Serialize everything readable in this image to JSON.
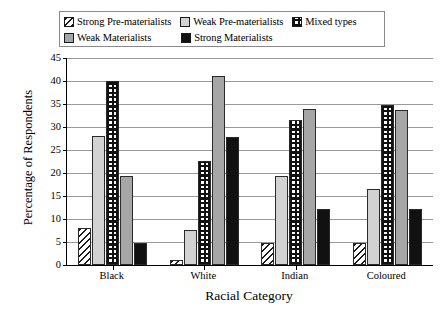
{
  "chart_data": {
    "type": "bar",
    "title": "",
    "xlabel": "Racial Category",
    "ylabel": "Percentage of Respondents",
    "categories": [
      "Black",
      "White",
      "Indian",
      "Coloured"
    ],
    "ylim": [
      0,
      45
    ],
    "yticks": [
      0,
      5,
      10,
      15,
      20,
      25,
      30,
      35,
      40,
      45
    ],
    "grid": true,
    "legend_position": "top",
    "series": [
      {
        "name": "Strong Pre-materialists",
        "pattern": "diagonal-hatch",
        "color": "#ffffff",
        "values": [
          8.0,
          1.0,
          4.8,
          4.8
        ]
      },
      {
        "name": "Weak Pre-materialists",
        "pattern": "light-gray",
        "color": "#d2d2d2",
        "values": [
          28.0,
          7.7,
          19.3,
          16.6
        ]
      },
      {
        "name": "Mixed types",
        "pattern": "checkered",
        "color": "#ffffff",
        "values": [
          40.0,
          22.7,
          31.5,
          34.7
        ]
      },
      {
        "name": "Weak Materialists",
        "pattern": "medium-gray",
        "color": "#a6a6a6",
        "values": [
          19.3,
          41.0,
          34.0,
          33.7
        ]
      },
      {
        "name": "Strong Materialists",
        "pattern": "solid-black",
        "color": "#111111",
        "values": [
          4.8,
          27.8,
          12.1,
          12.2
        ]
      }
    ]
  },
  "legend": {
    "items": [
      {
        "label": "Strong Pre-materialists",
        "swatch": "p-diag"
      },
      {
        "label": "Weak Pre-materialists",
        "swatch": "p-lightgray"
      },
      {
        "label": "Mixed types",
        "swatch": "p-check"
      },
      {
        "label": "Weak Materialists",
        "swatch": "p-medgray"
      },
      {
        "label": "Strong Materialists",
        "swatch": "p-black"
      }
    ]
  }
}
